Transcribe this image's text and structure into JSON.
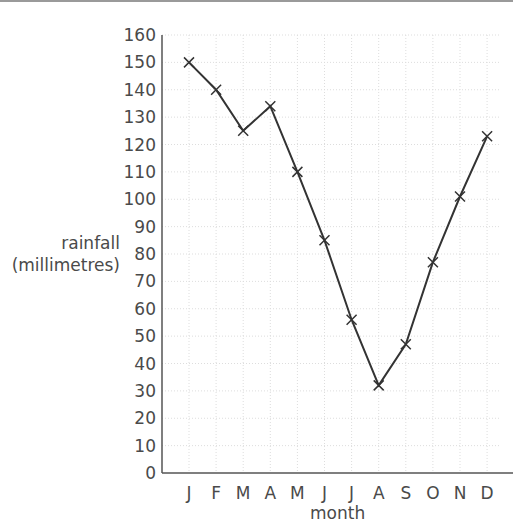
{
  "chart_data": {
    "type": "line",
    "title": "",
    "xlabel": "month",
    "ylabel_line1": "rainfall",
    "ylabel_line2": "(millimetres)",
    "categories": [
      "J",
      "F",
      "M",
      "A",
      "M",
      "J",
      "J",
      "A",
      "S",
      "O",
      "N",
      "D"
    ],
    "values": [
      150,
      140,
      125,
      134,
      110,
      85,
      56,
      32,
      47,
      77,
      101,
      123
    ],
    "ylim": [
      0,
      160
    ],
    "yticks": [
      0,
      10,
      20,
      30,
      40,
      50,
      60,
      70,
      80,
      90,
      100,
      110,
      120,
      130,
      140,
      150,
      160
    ],
    "grid": true,
    "marker": "x",
    "line_color": "#333333",
    "grid_color": "#dddddd"
  }
}
